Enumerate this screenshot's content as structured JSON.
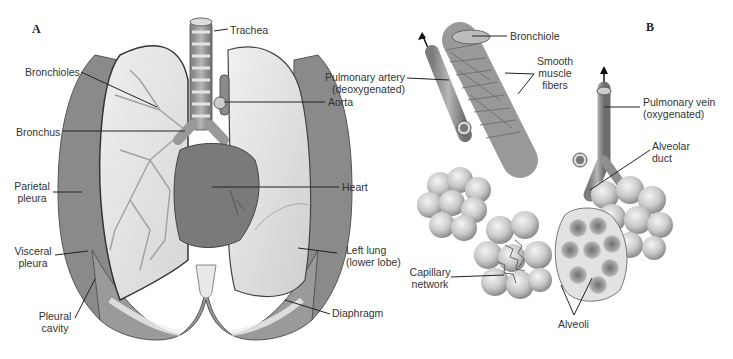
{
  "panels": {
    "A": {
      "letter": "A",
      "labels": {
        "trachea": "Trachea",
        "bronchioles": "Bronchioles",
        "aorta": "Aorta",
        "bronchus": "Bronchus",
        "heart": "Heart",
        "parietal_pleura_1": "Parietal",
        "parietal_pleura_2": "pleura",
        "left_lung_1": "Left lung",
        "left_lung_2": "(lower lobe)",
        "visceral_pleura_1": "Visceral",
        "visceral_pleura_2": "pleura",
        "diaphragm": "Diaphragm",
        "pleural_cavity_1": "Pleural",
        "pleural_cavity_2": "cavity"
      }
    },
    "B": {
      "letter": "B",
      "labels": {
        "bronchiole": "Bronchiole",
        "smooth_muscle_1": "Smooth",
        "smooth_muscle_2": "muscle",
        "smooth_muscle_3": "fibers",
        "pulmonary_artery_1": "Pulmonary artery",
        "pulmonary_artery_2": "(deoxygenated)",
        "pulmonary_vein_1": "Pulmonary vein",
        "pulmonary_vein_2": "(oxygenated)",
        "alveolar_duct_1": "Alveolar",
        "alveolar_duct_2": "duct",
        "capillary_1": "Capillary",
        "capillary_2": "network",
        "alveoli": "Alveoli"
      }
    }
  },
  "colors": {
    "tissue_dark": "#7a7a7a",
    "tissue_mid": "#9b9b9b",
    "tissue_light": "#d9d9d9",
    "lung_fill": "#e6e6e6",
    "line": "#222222"
  }
}
